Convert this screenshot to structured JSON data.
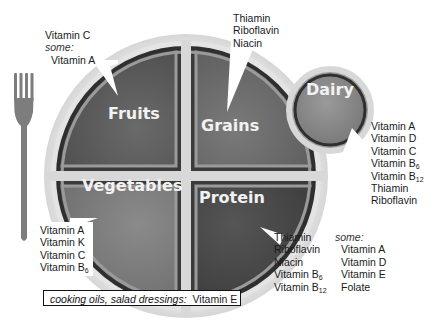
{
  "diagram": {
    "type": "MyPlate nutrient diagram",
    "groups": {
      "fruits": {
        "label": "Fruits",
        "nutrients": [
          "Vitamin C"
        ],
        "some_label": "some:",
        "some_nutrients": [
          "Vitamin A"
        ]
      },
      "grains": {
        "label": "Grains",
        "nutrients": [
          "Thiamin",
          "Riboflavin",
          "Niacin"
        ]
      },
      "dairy": {
        "label": "Dairy",
        "nutrients": [
          "Vitamin A",
          "Vitamin D",
          "Vitamin C",
          "Vitamin B",
          "Vitamin B",
          "Thiamin",
          "Riboflavin"
        ],
        "subscripts": [
          "",
          "",
          "",
          "6",
          "12",
          "",
          ""
        ]
      },
      "vegetables": {
        "label": "Vegetables",
        "nutrients": [
          "Vitamin A",
          "Vitamin K",
          "Vitamin C",
          "Vitamin B"
        ],
        "subscripts": [
          "",
          "",
          "",
          "6"
        ]
      },
      "protein": {
        "label": "Protein",
        "nutrients": [
          "Thiamin",
          "Riboflavin",
          "Niacin",
          "Vitamin B",
          "Vitamin B"
        ],
        "subscripts": [
          "",
          "",
          "",
          "6",
          "12"
        ],
        "some_label": "some:",
        "some_nutrients": [
          "Vitamin A",
          "Vitamin D",
          "Vitamin E",
          "Folate"
        ]
      }
    },
    "oils": {
      "label": "cooking oils, salad dressings:",
      "nutrient": "Vitamin E"
    },
    "colors": {
      "plate_rim": "#d9d9d9",
      "plate_inner": "#ececec",
      "quadrant_border": "#333333",
      "fruits": "#5e5e5e",
      "grains": "#6a6a6a",
      "vegetables": "#7a7a7a",
      "protein": "#4a4a4a",
      "dairy": "#8a8a8a",
      "fork": "#7d7d7d"
    }
  }
}
